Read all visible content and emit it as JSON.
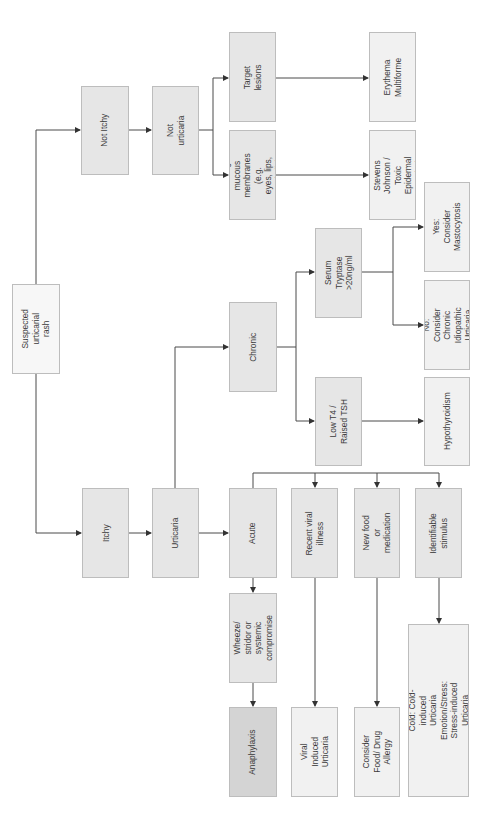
{
  "diagram": {
    "type": "flowchart",
    "orientation": "rotated-90-ccw",
    "colors": {
      "node_fill": "#e6e6e6",
      "outcome_fill": "#f1f1f1",
      "start_fill": "#f7f7f7",
      "emergency_fill": "#d4d4d4",
      "border": "#bdbdbd",
      "line": "#4a4a4a",
      "text": "#3a3a3a"
    },
    "nodes": {
      "suspected": {
        "label": "Suspected urticarial\nrash",
        "x": 12,
        "y": 284,
        "w": 48,
        "h": 90,
        "style": "start"
      },
      "itchy": {
        "label": "Itchy",
        "x": 82,
        "y": 488,
        "w": 47,
        "h": 90,
        "style": ""
      },
      "not_itchy": {
        "label": "Not Itchy",
        "x": 81,
        "y": 86,
        "w": 48,
        "h": 89,
        "style": ""
      },
      "urticaria": {
        "label": "Urticaria",
        "x": 152,
        "y": 488,
        "w": 47,
        "h": 90,
        "style": ""
      },
      "not_urticaria": {
        "label": "Not urticaria",
        "x": 152,
        "y": 86,
        "w": 47,
        "h": 89,
        "style": ""
      },
      "target_lesions": {
        "label": "Target lesions",
        "x": 229,
        "y": 32,
        "w": 47,
        "h": 90,
        "style": ""
      },
      "blistering": {
        "label": "Blistering of mucous\nmembranes (e.g.\neyes, lips, genitalia)",
        "x": 229,
        "y": 130,
        "w": 47,
        "h": 90,
        "style": ""
      },
      "erythema": {
        "label": "Erythema Multiforme",
        "x": 369,
        "y": 32,
        "w": 47,
        "h": 90,
        "style": "light"
      },
      "stevens_johnson": {
        "label": "Consider Stevens\nJohnson / Toxic\nEpidermal Necrolysis",
        "x": 369,
        "y": 130,
        "w": 47,
        "h": 90,
        "style": "light"
      },
      "chronic": {
        "label": "Chronic",
        "x": 229,
        "y": 302,
        "w": 48,
        "h": 90,
        "style": ""
      },
      "serum_tryptase": {
        "label": "Serum Tryptase\n>20ng/ml",
        "x": 315,
        "y": 228,
        "w": 47,
        "h": 90,
        "style": ""
      },
      "low_t4": {
        "label": "Low T4 / Raised TSH",
        "x": 315,
        "y": 377,
        "w": 47,
        "h": 89,
        "style": ""
      },
      "mastocytosis": {
        "label": "Yes: Consider\nMastocytosis",
        "x": 424,
        "y": 182,
        "w": 46,
        "h": 90,
        "style": "light"
      },
      "chronic_idiopathic": {
        "label": "No: Consider Chronic\nIdiopathic Urticaria",
        "x": 424,
        "y": 280,
        "w": 46,
        "h": 90,
        "style": "light"
      },
      "hypothyroidism": {
        "label": "Hypothyroidism",
        "x": 424,
        "y": 377,
        "w": 46,
        "h": 89,
        "style": "light"
      },
      "acute": {
        "label": "Acute",
        "x": 229,
        "y": 488,
        "w": 48,
        "h": 90,
        "style": ""
      },
      "recent_viral": {
        "label": "Recent viral illness",
        "x": 291,
        "y": 488,
        "w": 47,
        "h": 90,
        "style": ""
      },
      "new_food": {
        "label": "New food or\nmedication",
        "x": 354,
        "y": 488,
        "w": 46,
        "h": 90,
        "style": ""
      },
      "identifiable": {
        "label": "Identifiable stimulus",
        "x": 415,
        "y": 488,
        "w": 47,
        "h": 90,
        "style": ""
      },
      "wheeze": {
        "label": "Wheeze/ stridor or\nsystemic compromise",
        "x": 229,
        "y": 593,
        "w": 48,
        "h": 90,
        "style": ""
      },
      "anaphylaxis": {
        "label": "Anaphylaxis",
        "x": 229,
        "y": 707,
        "w": 48,
        "h": 90,
        "style": "dark"
      },
      "viral_induced": {
        "label": "Viral Induced\nUrticaria",
        "x": 291,
        "y": 707,
        "w": 47,
        "h": 90,
        "style": "light"
      },
      "food_drug": {
        "label": "Consider Food/ Drug\nAllergy",
        "x": 354,
        "y": 707,
        "w": 46,
        "h": 90,
        "style": "light"
      },
      "stimulus_types": {
        "label": "Touch: Contact Urticaria\nCold: Cold-induced Urticaria\nEmotion/Stress: Stress-induced Urticaria\nSunlight: Solar Urticaria",
        "x": 408,
        "y": 624,
        "w": 61,
        "h": 173,
        "style": "light"
      }
    },
    "edges": [
      {
        "from": "suspected",
        "to": "not_itchy"
      },
      {
        "from": "suspected",
        "to": "itchy"
      },
      {
        "from": "not_itchy",
        "to": "not_urticaria"
      },
      {
        "from": "not_urticaria",
        "to": "target_lesions"
      },
      {
        "from": "not_urticaria",
        "to": "blistering"
      },
      {
        "from": "target_lesions",
        "to": "erythema"
      },
      {
        "from": "blistering",
        "to": "stevens_johnson"
      },
      {
        "from": "itchy",
        "to": "urticaria"
      },
      {
        "from": "urticaria",
        "to": "chronic"
      },
      {
        "from": "urticaria",
        "to": "acute"
      },
      {
        "from": "chronic",
        "to": "serum_tryptase"
      },
      {
        "from": "chronic",
        "to": "low_t4"
      },
      {
        "from": "serum_tryptase",
        "to": "mastocytosis"
      },
      {
        "from": "serum_tryptase",
        "to": "chronic_idiopathic"
      },
      {
        "from": "low_t4",
        "to": "hypothyroidism"
      },
      {
        "from": "acute",
        "to": "recent_viral"
      },
      {
        "from": "acute",
        "to": "new_food"
      },
      {
        "from": "acute",
        "to": "identifiable"
      },
      {
        "from": "acute",
        "to": "wheeze"
      },
      {
        "from": "wheeze",
        "to": "anaphylaxis"
      },
      {
        "from": "recent_viral",
        "to": "viral_induced"
      },
      {
        "from": "new_food",
        "to": "food_drug"
      },
      {
        "from": "identifiable",
        "to": "stimulus_types"
      }
    ]
  }
}
